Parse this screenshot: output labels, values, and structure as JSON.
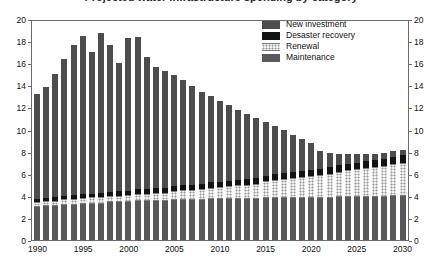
{
  "chart": {
    "title": "Projected water infrastructure spending by category",
    "y_axis_left_label": "",
    "y_axis_right_label": "",
    "x_axis_label": ""
  },
  "axis": {
    "y_ticks": [
      "0",
      "2",
      "4",
      "6",
      "8",
      "10",
      "12",
      "14",
      "16",
      "18",
      "20"
    ],
    "x_ticks": [
      "1990",
      "1995",
      "2000",
      "2005",
      "2010",
      "2015",
      "2020",
      "2025",
      "2030"
    ]
  },
  "legend": {
    "position": "top-right",
    "items": [
      {
        "label": "New investment",
        "color": "#4d4d4d",
        "key": "new_investment"
      },
      {
        "label": "Desaster recovery",
        "color": "#131313",
        "key": "disaster_recovery"
      },
      {
        "label": "Renewal",
        "color": "#f2f2f2",
        "key": "renewal"
      },
      {
        "label": "Maintenance",
        "color": "#585858",
        "key": "maintenance"
      }
    ]
  },
  "chart_data": {
    "type": "bar",
    "stacked": true,
    "title": "Projected water infrastructure spending by category",
    "xlabel": "",
    "ylabel": "",
    "ylim": [
      0,
      20
    ],
    "ytick_step": 2,
    "grid": false,
    "legend_position": "top-right",
    "categories": [
      "1990",
      "1991",
      "1992",
      "1993",
      "1994",
      "1995",
      "1996",
      "1997",
      "1998",
      "1999",
      "2000",
      "2001",
      "2002",
      "2003",
      "2004",
      "2005",
      "2006",
      "2007",
      "2008",
      "2009",
      "2010",
      "2011",
      "2012",
      "2013",
      "2014",
      "2015",
      "2016",
      "2017",
      "2018",
      "2019",
      "2020",
      "2021",
      "2022",
      "2023",
      "2024",
      "2025",
      "2026",
      "2027",
      "2028",
      "2029",
      "2030"
    ],
    "series": [
      {
        "name": "Maintenance",
        "color": "#585858",
        "values": [
          3.0,
          3.1,
          3.1,
          3.2,
          3.2,
          3.3,
          3.3,
          3.3,
          3.4,
          3.4,
          3.4,
          3.5,
          3.5,
          3.5,
          3.5,
          3.6,
          3.6,
          3.6,
          3.6,
          3.7,
          3.7,
          3.7,
          3.7,
          3.7,
          3.7,
          3.8,
          3.8,
          3.8,
          3.8,
          3.8,
          3.8,
          3.8,
          3.8,
          3.9,
          3.9,
          3.9,
          3.9,
          3.9,
          3.9,
          4.0,
          4.0
        ]
      },
      {
        "name": "Renewal",
        "color": "#f2f2f2",
        "values": [
          0.4,
          0.42,
          0.45,
          0.47,
          0.5,
          0.52,
          0.55,
          0.57,
          0.6,
          0.62,
          0.65,
          0.68,
          0.7,
          0.75,
          0.8,
          0.85,
          0.9,
          0.95,
          1.0,
          1.05,
          1.1,
          1.18,
          1.25,
          1.32,
          1.4,
          1.5,
          1.6,
          1.7,
          1.8,
          1.9,
          2.0,
          2.1,
          2.2,
          2.3,
          2.4,
          2.5,
          2.6,
          2.7,
          2.8,
          2.9,
          3.0
        ]
      },
      {
        "name": "Desaster recovery",
        "color": "#131313",
        "values": [
          0.3,
          0.3,
          0.32,
          0.32,
          0.34,
          0.35,
          0.36,
          0.36,
          0.38,
          0.38,
          0.4,
          0.4,
          0.42,
          0.42,
          0.44,
          0.45,
          0.45,
          0.46,
          0.46,
          0.48,
          0.48,
          0.5,
          0.5,
          0.5,
          0.52,
          0.52,
          0.54,
          0.54,
          0.55,
          0.55,
          0.56,
          0.56,
          0.58,
          0.58,
          0.6,
          0.6,
          0.62,
          0.62,
          0.64,
          0.65,
          0.66
        ]
      },
      {
        "name": "New investment",
        "color": "#4d4d4d",
        "values": [
          9.5,
          10.0,
          11.2,
          12.4,
          13.6,
          14.3,
          12.8,
          14.5,
          13.3,
          11.6,
          13.8,
          13.8,
          11.9,
          11.0,
          10.6,
          10.0,
          9.5,
          8.9,
          8.3,
          7.8,
          7.3,
          6.8,
          6.3,
          5.9,
          5.4,
          4.9,
          4.4,
          3.9,
          3.4,
          2.9,
          2.4,
          1.6,
          1.3,
          1.0,
          0.9,
          0.8,
          0.7,
          0.6,
          0.55,
          0.5,
          0.45
        ]
      }
    ],
    "totals": [
      13.2,
      13.8,
      15.1,
      16.4,
      17.6,
      18.5,
      17.0,
      18.7,
      17.7,
      16.0,
      18.3,
      18.4,
      16.5,
      15.7,
      15.3,
      14.8,
      14.4,
      13.9,
      13.4,
      13.0,
      12.6,
      12.2,
      11.8,
      11.4,
      11.0,
      10.7,
      10.3,
      9.9,
      9.6,
      9.2,
      8.8,
      8.1,
      7.9,
      7.8,
      7.8,
      7.8,
      7.8,
      7.8,
      7.9,
      8.1,
      8.1
    ]
  }
}
